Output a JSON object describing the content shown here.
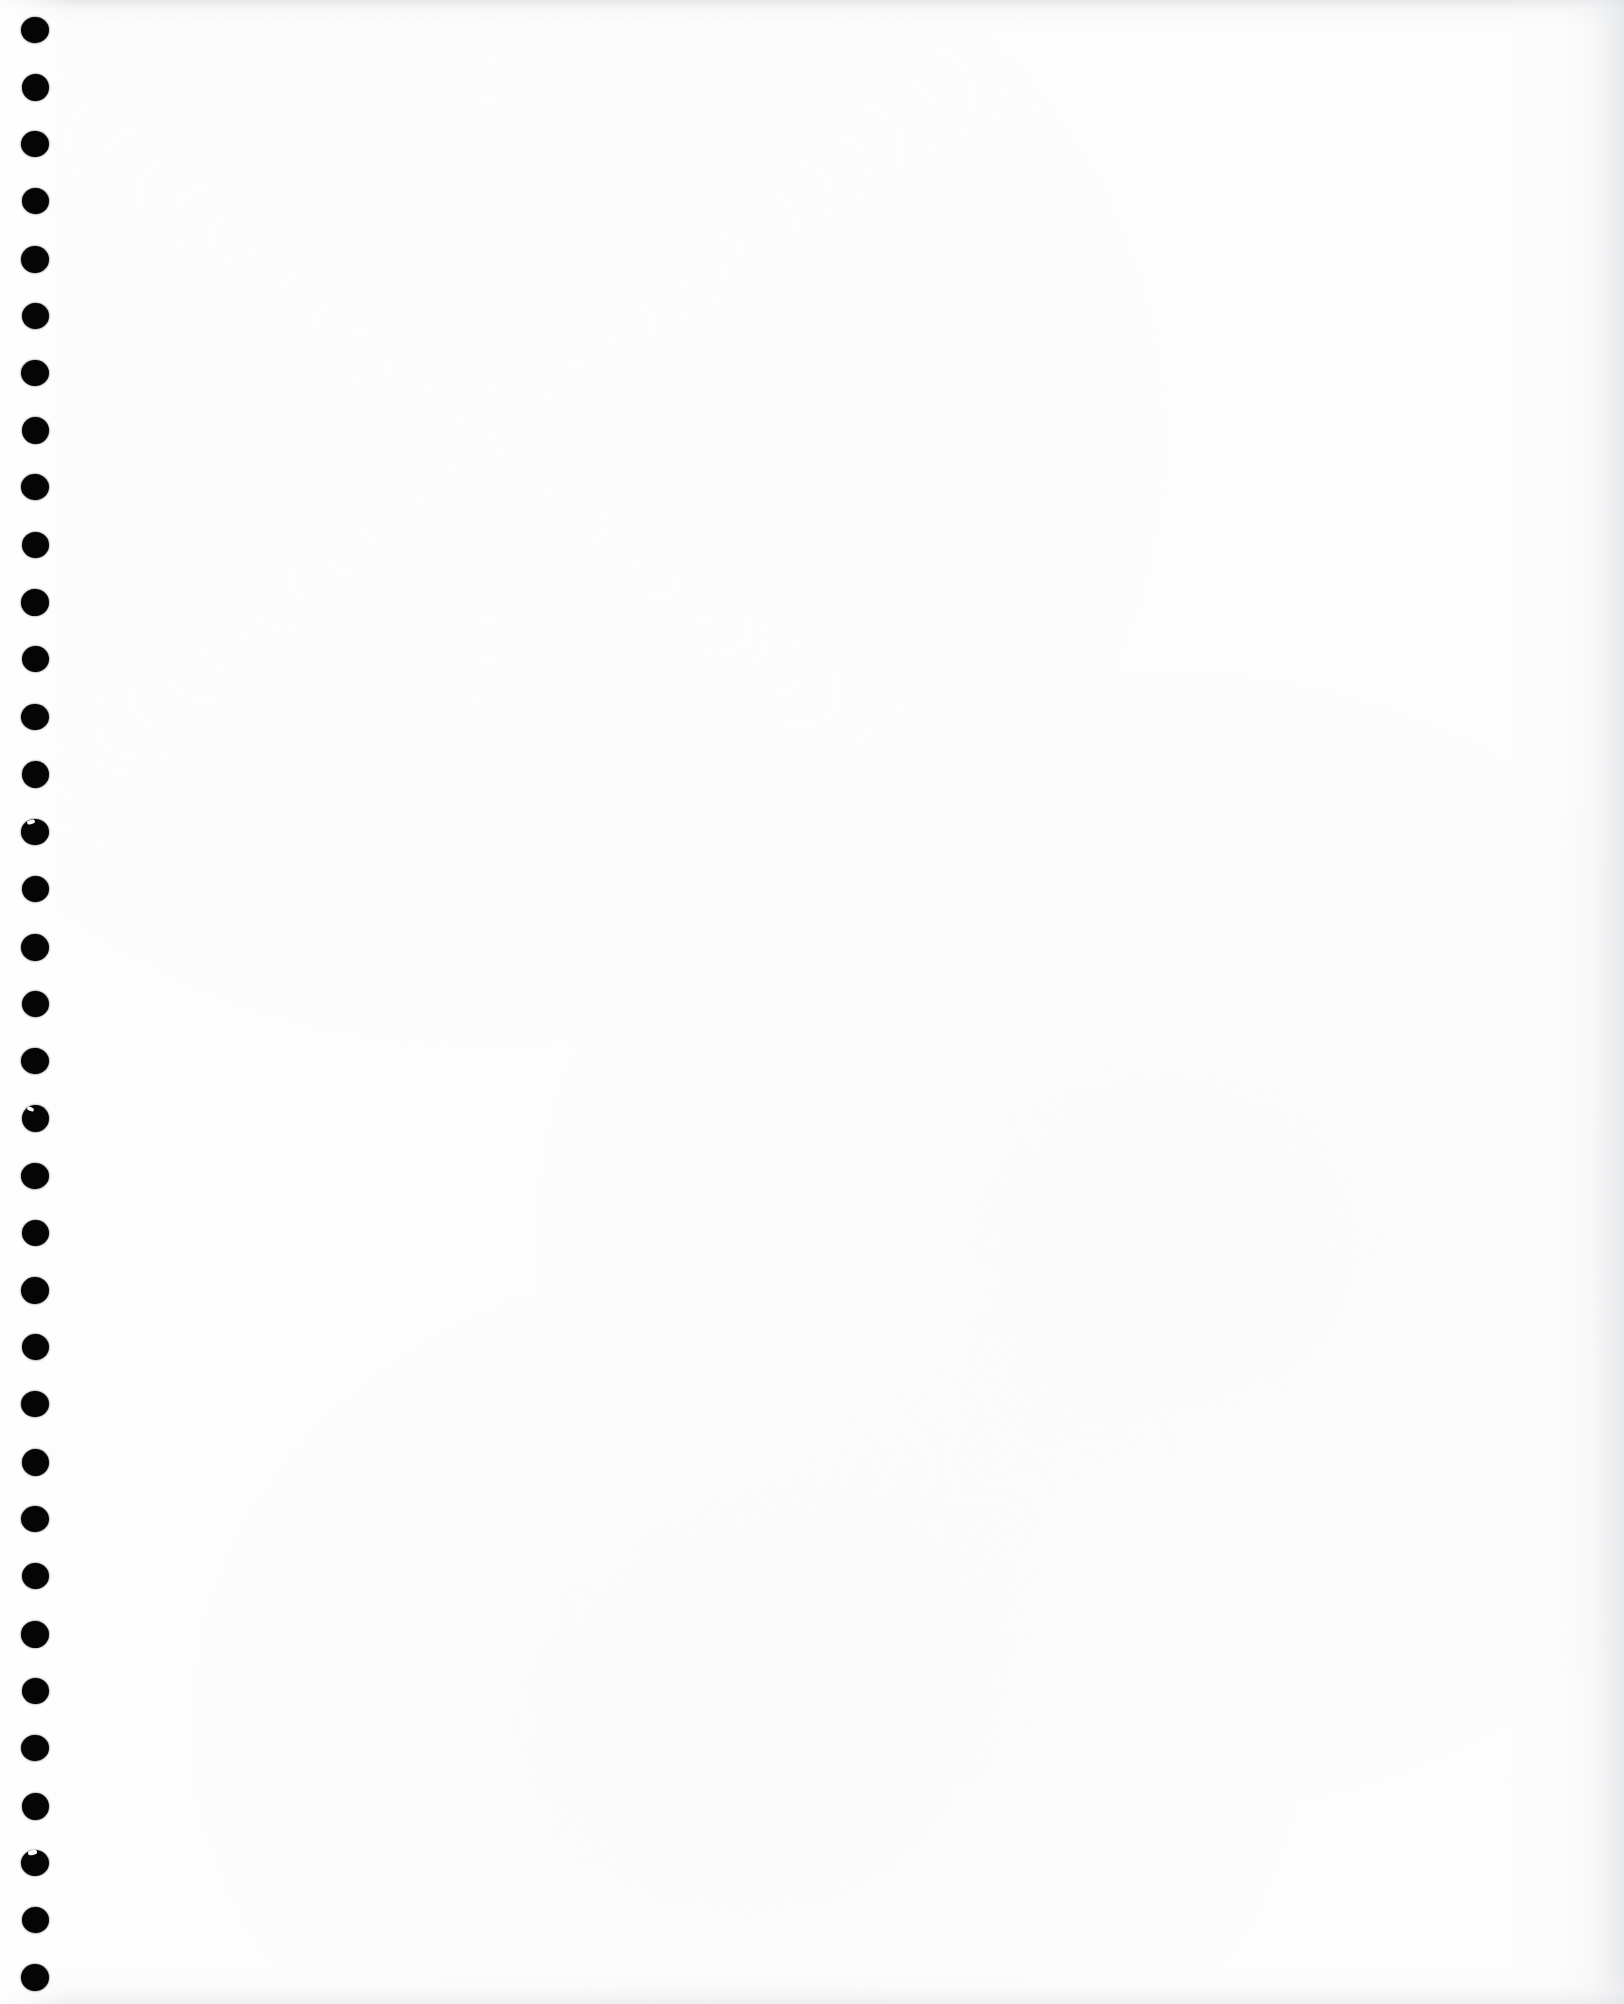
{
  "document": {
    "kind": "scanned-page",
    "page_state": "blank",
    "content_text": "",
    "page_width": 1624,
    "page_height": 2004
  },
  "colors": {
    "paper": "#fdfdfd",
    "paper_highlight": "#ffffff",
    "punch_hole": "#050505",
    "edge_shadow": "#e2e3e5",
    "nick_highlight": "#fbfbfb"
  },
  "binding": {
    "type": "punch-hole-column",
    "edge": "left",
    "hole_count": 35,
    "hole_center_x": 35,
    "hole_diameter": 27,
    "hole_spacing": 57.2,
    "first_hole_center_y": 30,
    "last_hole_center_y": 1976,
    "holes": [
      {
        "cy": 30,
        "w": 28,
        "h": 26,
        "rot": -2,
        "nick": null
      },
      {
        "cy": 87,
        "w": 27,
        "h": 27,
        "rot": 1,
        "nick": null
      },
      {
        "cy": 144,
        "w": 28,
        "h": 26,
        "rot": -1,
        "nick": null
      },
      {
        "cy": 201,
        "w": 27,
        "h": 26,
        "rot": 2,
        "nick": null
      },
      {
        "cy": 259,
        "w": 28,
        "h": 27,
        "rot": 0,
        "nick": null
      },
      {
        "cy": 316,
        "w": 27,
        "h": 26,
        "rot": -2,
        "nick": null
      },
      {
        "cy": 373,
        "w": 28,
        "h": 26,
        "rot": 1,
        "nick": null
      },
      {
        "cy": 430,
        "w": 27,
        "h": 27,
        "rot": -1,
        "nick": null
      },
      {
        "cy": 487,
        "w": 28,
        "h": 26,
        "rot": 2,
        "nick": null
      },
      {
        "cy": 545,
        "w": 27,
        "h": 26,
        "rot": 0,
        "nick": null
      },
      {
        "cy": 602,
        "w": 28,
        "h": 27,
        "rot": -2,
        "nick": null
      },
      {
        "cy": 659,
        "w": 27,
        "h": 26,
        "rot": 1,
        "nick": null
      },
      {
        "cy": 717,
        "w": 28,
        "h": 26,
        "rot": -1,
        "nick": null
      },
      {
        "cy": 774,
        "w": 27,
        "h": 27,
        "rot": 2,
        "nick": null
      },
      {
        "cy": 832,
        "w": 28,
        "h": 26,
        "rot": 0,
        "nick": {
          "dx": -4,
          "dy": -10,
          "w": 8,
          "h": 4,
          "rot": -18
        }
      },
      {
        "cy": 889,
        "w": 27,
        "h": 26,
        "rot": -2,
        "nick": null
      },
      {
        "cy": 947,
        "w": 28,
        "h": 27,
        "rot": 1,
        "nick": null
      },
      {
        "cy": 1004,
        "w": 27,
        "h": 26,
        "rot": -1,
        "nick": null
      },
      {
        "cy": 1061,
        "w": 28,
        "h": 26,
        "rot": 2,
        "nick": null
      },
      {
        "cy": 1118,
        "w": 27,
        "h": 27,
        "rot": 0,
        "nick": {
          "dx": -5,
          "dy": -9,
          "w": 7,
          "h": 4,
          "rot": 22
        }
      },
      {
        "cy": 1176,
        "w": 28,
        "h": 26,
        "rot": -2,
        "nick": null
      },
      {
        "cy": 1233,
        "w": 27,
        "h": 26,
        "rot": 1,
        "nick": null
      },
      {
        "cy": 1290,
        "w": 28,
        "h": 27,
        "rot": -1,
        "nick": null
      },
      {
        "cy": 1347,
        "w": 27,
        "h": 26,
        "rot": 2,
        "nick": null
      },
      {
        "cy": 1404,
        "w": 28,
        "h": 26,
        "rot": 0,
        "nick": null
      },
      {
        "cy": 1462,
        "w": 27,
        "h": 27,
        "rot": -2,
        "nick": null
      },
      {
        "cy": 1519,
        "w": 28,
        "h": 26,
        "rot": 1,
        "nick": null
      },
      {
        "cy": 1576,
        "w": 27,
        "h": 26,
        "rot": -1,
        "nick": null
      },
      {
        "cy": 1634,
        "w": 28,
        "h": 27,
        "rot": 2,
        "nick": null
      },
      {
        "cy": 1691,
        "w": 27,
        "h": 26,
        "rot": 0,
        "nick": null
      },
      {
        "cy": 1748,
        "w": 28,
        "h": 26,
        "rot": -2,
        "nick": null
      },
      {
        "cy": 1806,
        "w": 27,
        "h": 27,
        "rot": 1,
        "nick": null
      },
      {
        "cy": 1863,
        "w": 28,
        "h": 26,
        "rot": -1,
        "nick": {
          "dx": -3,
          "dy": -11,
          "w": 9,
          "h": 5,
          "rot": -12
        }
      },
      {
        "cy": 1920,
        "w": 27,
        "h": 26,
        "rot": 2,
        "nick": null
      },
      {
        "cy": 1977,
        "w": 28,
        "h": 27,
        "rot": 0,
        "nick": null
      }
    ]
  }
}
